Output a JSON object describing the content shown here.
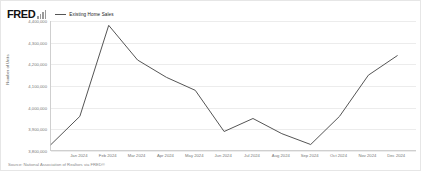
{
  "header": {
    "logo_text": "FRED",
    "logo_icon": "bar-chart-icon"
  },
  "legend": {
    "items": [
      {
        "label": "Existing Home Sales",
        "color": "#555555"
      }
    ]
  },
  "footer": {
    "source": "Source: National Association of Realtors via FRED®"
  },
  "chart_data": {
    "type": "line",
    "title": "",
    "xlabel": "",
    "ylabel": "Number of Units",
    "ylim": [
      3800000,
      4400000
    ],
    "yticks": [
      4400000,
      4300000,
      4200000,
      4100000,
      4000000,
      3900000,
      3800000
    ],
    "ytick_labels": [
      "4,400,000",
      "4,300,000",
      "4,200,000",
      "4,100,000",
      "4,000,000",
      "3,900,000",
      "3,800,000"
    ],
    "grid": true,
    "legend_position": "top-left",
    "categories": [
      "Dec 2023",
      "Jan 2024",
      "Feb 2024",
      "Mar 2024",
      "Apr 2024",
      "May 2024",
      "Jun 2024",
      "Jul 2024",
      "Aug 2024",
      "Sep 2024",
      "Oct 2024",
      "Nov 2024",
      "Dec 2024"
    ],
    "xtick_labels": [
      "Jan 2024",
      "Feb 2024",
      "Mar 2024",
      "Apr 2024",
      "May 2024",
      "Jun 2024",
      "Jul 2024",
      "Aug 2024",
      "Sep 2024",
      "Oct 2024",
      "Nov 2024",
      "Dec 2024"
    ],
    "series": [
      {
        "name": "Existing Home Sales",
        "color": "#555555",
        "values": [
          3830000,
          3960000,
          4380000,
          4220000,
          4140000,
          4080000,
          3890000,
          3950000,
          3880000,
          3830000,
          3960000,
          4150000,
          4240000
        ]
      }
    ]
  }
}
